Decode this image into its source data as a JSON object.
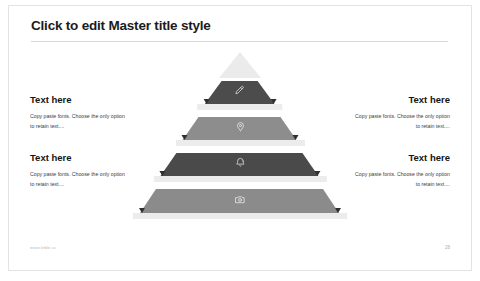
{
  "slide": {
    "title": "Click to edit Master title style",
    "background_color": "#ffffff",
    "border_color": "#e3e3e3"
  },
  "text_blocks": [
    {
      "position": "left-top",
      "heading": "Text here",
      "body_line1": "Copy paste fonts. Choose the only option",
      "body_line2": "to retain text....",
      "align": "left"
    },
    {
      "position": "left-bottom",
      "heading": "Text here",
      "body_line1": "Copy paste fonts. Choose the only option",
      "body_line2": "to retain text....",
      "align": "left"
    },
    {
      "position": "right-top",
      "heading": "Text here",
      "body_line1": "Copy paste fonts. Choose the only option",
      "body_line2": "to retain text....",
      "align": "right"
    },
    {
      "position": "right-bottom",
      "heading": "Text here",
      "body_line1": "Copy paste fonts. Choose the only option",
      "body_line2": "to retain text....",
      "align": "right"
    }
  ],
  "pyramid": {
    "apex_color": "#ebebeb",
    "shelf_color": "#ececec",
    "pin_color": "#2f2f2f",
    "layers": [
      {
        "index": 1,
        "icon": "pencil-icon",
        "color": "#4c4c4c"
      },
      {
        "index": 2,
        "icon": "location-pin-icon",
        "color": "#8d8d8d"
      },
      {
        "index": 3,
        "icon": "bell-icon",
        "color": "#4a4a4a"
      },
      {
        "index": 4,
        "icon": "camera-icon",
        "color": "#8b8b8b"
      }
    ]
  },
  "footer": {
    "url": "www.leble.cc",
    "page_number": "28"
  }
}
